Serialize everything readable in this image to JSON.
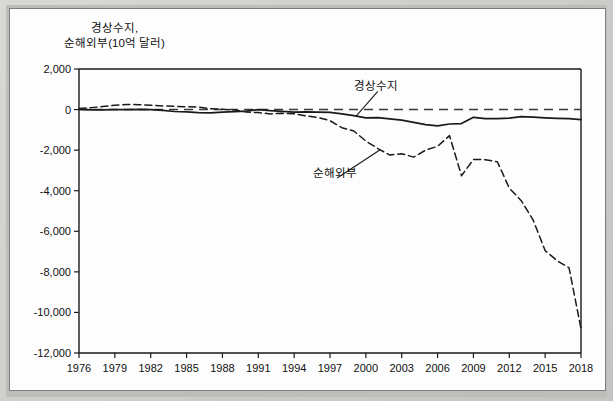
{
  "figure": {
    "background_color": "#fdfdfd",
    "border_color": "#7e7e7c",
    "line_color": "#1a1a1a"
  },
  "chart_data": {
    "type": "line",
    "title": "",
    "subtitle": "",
    "ylabel": "경상수지,\n순해외부(10억 달러)",
    "xlabel": "",
    "grid": false,
    "legend_position": "inline-annotation",
    "xlim": [
      1976,
      2018
    ],
    "ylim": [
      -12000,
      2000
    ],
    "yticks": [
      2000,
      0,
      -2000,
      -4000,
      -6000,
      -8000,
      -10000,
      -12000
    ],
    "ytick_labels": [
      "2,000",
      "0",
      "-2,000",
      "-4,000",
      "-6,000",
      "-8,000",
      "-10,000",
      "-12,000"
    ],
    "xticks": [
      1976,
      1979,
      1982,
      1985,
      1988,
      1991,
      1994,
      1997,
      2000,
      2003,
      2006,
      2009,
      2012,
      2015,
      2018
    ],
    "xtick_labels": [
      "1976",
      "1979",
      "1982",
      "1985",
      "1988",
      "1991",
      "1994",
      "1997",
      "2000",
      "2003",
      "2006",
      "2009",
      "2012",
      "2015",
      "2018"
    ],
    "zero_reference_line": 0,
    "x": [
      1976,
      1977,
      1978,
      1979,
      1980,
      1981,
      1982,
      1983,
      1984,
      1985,
      1986,
      1987,
      1988,
      1989,
      1990,
      1991,
      1992,
      1993,
      1994,
      1995,
      1996,
      1997,
      1998,
      1999,
      2000,
      2001,
      2002,
      2003,
      2004,
      2005,
      2006,
      2007,
      2008,
      2009,
      2010,
      2011,
      2012,
      2013,
      2014,
      2015,
      2016,
      2017,
      2018
    ],
    "series": [
      {
        "name": "경상수지",
        "style": "solid",
        "annotation_label": "경상수지",
        "values": [
          5,
          -15,
          -15,
          -1,
          2,
          5,
          -6,
          -39,
          -94,
          -118,
          -147,
          -161,
          -122,
          -99,
          -79,
          -3,
          -51,
          -85,
          -122,
          -114,
          -125,
          -141,
          -216,
          -302,
          -411,
          -396,
          -458,
          -519,
          -629,
          -740,
          -807,
          -711,
          -690,
          -384,
          -442,
          -446,
          -426,
          -349,
          -373,
          -408,
          -433,
          -449,
          -491
        ]
      },
      {
        "name": "순해외부",
        "style": "dashed",
        "annotation_label": "순해외부",
        "values": [
          51,
          89,
          152,
          210,
          253,
          239,
          210,
          180,
          160,
          140,
          120,
          42,
          10,
          -15,
          -125,
          -148,
          -214,
          -186,
          -209,
          -314,
          -387,
          -549,
          -893,
          -1060,
          -1552,
          -1921,
          -2242,
          -2176,
          -2343,
          -2000,
          -1810,
          -1285,
          -3260,
          -2460,
          -2470,
          -2570,
          -3870,
          -4490,
          -5450,
          -6950,
          -7450,
          -7800,
          -10800
        ]
      }
    ],
    "annotations": [
      {
        "text": "경상수지",
        "x_year": 2001.0,
        "y_value": 1190,
        "points_to_x": 1999.2,
        "points_to_y": -310
      },
      {
        "text": "순해외부",
        "x_year": 1997.6,
        "y_value": -3080,
        "points_to_x": 2001.2,
        "points_to_y": -1980
      }
    ]
  }
}
